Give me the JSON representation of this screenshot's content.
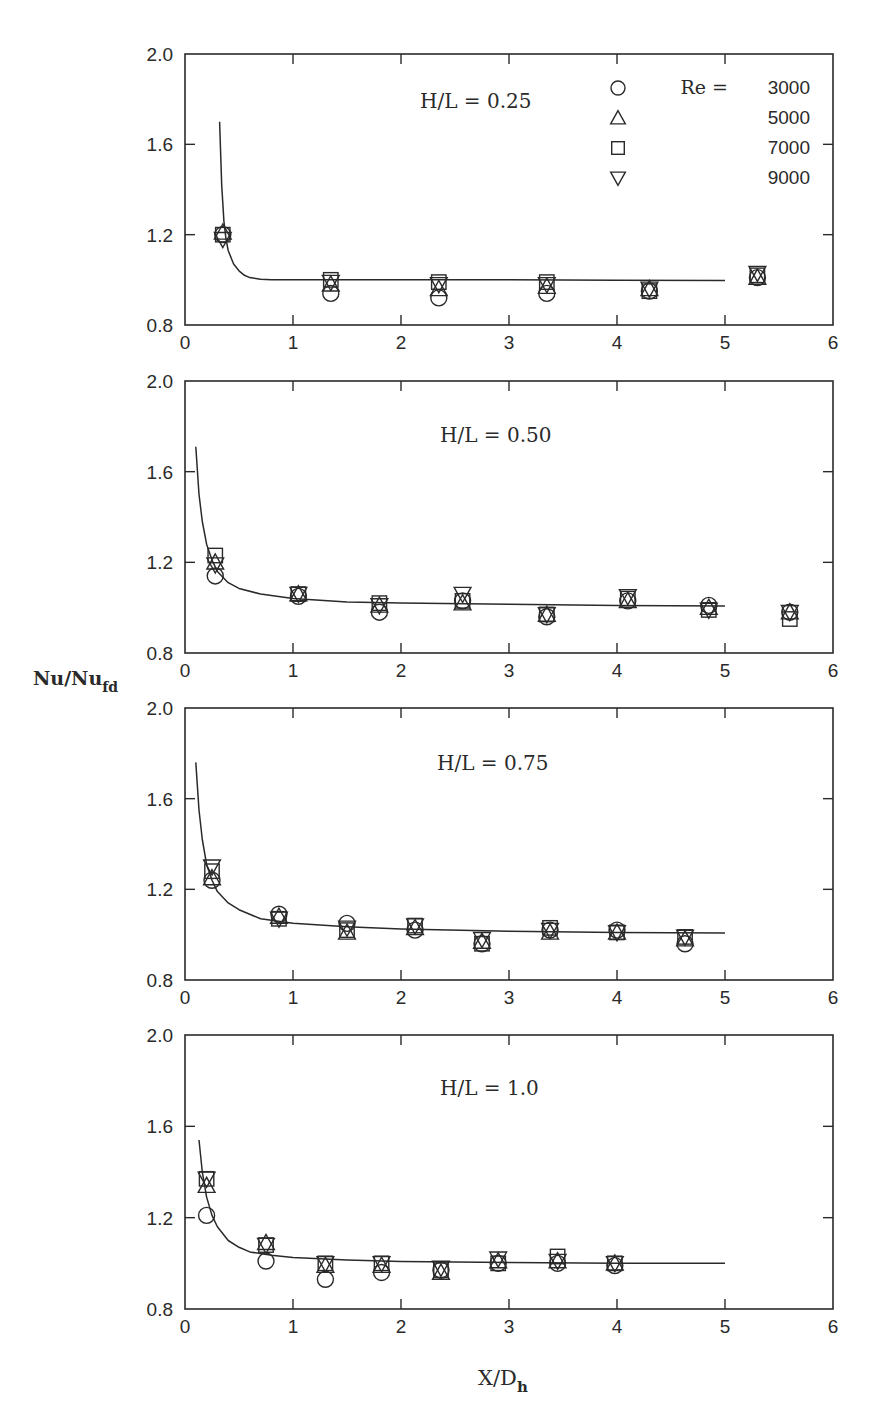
{
  "figure": {
    "ylabel_main": "Nu/Nu",
    "ylabel_sub": "fd",
    "xlabel_main": "X/D",
    "xlabel_sub": "h",
    "legend": {
      "title_prefix": "Re =",
      "entries": [
        {
          "symbol": "circle",
          "label": "3000"
        },
        {
          "symbol": "triangle-up",
          "label": "5000"
        },
        {
          "symbol": "square",
          "label": "7000"
        },
        {
          "symbol": "triangle-down",
          "label": "9000"
        }
      ]
    }
  },
  "chart_data": [
    {
      "type": "scatter",
      "title": "H/L = 0.25",
      "xlabel": "X/D_h",
      "ylabel": "Nu/Nu_fd",
      "xlim": [
        0,
        6
      ],
      "ylim": [
        0.8,
        2.0
      ],
      "xticks": [
        "0",
        "1",
        "2",
        "3",
        "4",
        "5",
        "6"
      ],
      "yticks": [
        "0.8",
        "1.2",
        "1.6",
        "2.0"
      ],
      "grid": false,
      "legend_position": "upper right",
      "x": [
        0.35,
        1.35,
        2.35,
        3.35,
        4.3,
        5.3
      ],
      "series": [
        {
          "name": "Re = 3000",
          "marker": "circle",
          "values": [
            1.2,
            0.94,
            0.92,
            0.94,
            0.95,
            1.01
          ]
        },
        {
          "name": "Re = 5000",
          "marker": "triangle-up",
          "values": [
            1.21,
            0.98,
            0.96,
            0.97,
            0.96,
            1.01
          ]
        },
        {
          "name": "Re = 7000",
          "marker": "square",
          "values": [
            1.2,
            1.0,
            0.99,
            0.99,
            0.95,
            1.02
          ]
        },
        {
          "name": "Re = 9000",
          "marker": "triangle-down",
          "values": [
            1.18,
            0.99,
            0.98,
            0.98,
            0.96,
            1.03
          ]
        }
      ],
      "fit_curve": {
        "x": [
          0.32,
          0.34,
          0.36,
          0.38,
          0.4,
          0.45,
          0.5,
          0.55,
          0.6,
          0.7,
          0.8,
          1.0,
          2.0,
          3.0,
          4.0,
          5.0
        ],
        "y": [
          1.7,
          1.42,
          1.26,
          1.18,
          1.13,
          1.07,
          1.04,
          1.02,
          1.01,
          1.003,
          1.0,
          1.0,
          1.0,
          1.0,
          0.998,
          0.997
        ]
      }
    },
    {
      "type": "scatter",
      "title": "H/L = 0.50",
      "xlabel": "X/D_h",
      "ylabel": "Nu/Nu_fd",
      "xlim": [
        0,
        6
      ],
      "ylim": [
        0.8,
        2.0
      ],
      "xticks": [
        "0",
        "1",
        "2",
        "3",
        "4",
        "5",
        "6"
      ],
      "yticks": [
        "0.8",
        "1.2",
        "1.6",
        "2.0"
      ],
      "grid": false,
      "x": [
        0.28,
        1.05,
        1.8,
        2.57,
        3.35,
        4.1,
        4.85,
        5.6
      ],
      "series": [
        {
          "name": "Re = 3000",
          "marker": "circle",
          "values": [
            1.14,
            1.05,
            0.98,
            1.03,
            0.96,
            1.03,
            1.01,
            0.98
          ]
        },
        {
          "name": "Re = 5000",
          "marker": "triangle-up",
          "values": [
            1.2,
            1.06,
            1.01,
            1.02,
            0.97,
            1.03,
            1.0,
            0.98
          ]
        },
        {
          "name": "Re = 7000",
          "marker": "square",
          "values": [
            1.23,
            1.06,
            1.02,
            1.03,
            0.97,
            1.04,
            0.99,
            0.95
          ]
        },
        {
          "name": "Re = 9000",
          "marker": "triangle-down",
          "values": [
            1.19,
            1.06,
            1.01,
            1.06,
            0.97,
            1.05,
            0.99,
            0.98
          ]
        }
      ],
      "fit_curve": {
        "x": [
          0.1,
          0.13,
          0.16,
          0.2,
          0.25,
          0.3,
          0.4,
          0.5,
          0.7,
          1.0,
          1.5,
          2.0,
          3.0,
          4.0,
          5.0
        ],
        "y": [
          1.71,
          1.5,
          1.38,
          1.28,
          1.21,
          1.16,
          1.11,
          1.085,
          1.06,
          1.04,
          1.025,
          1.02,
          1.015,
          1.01,
          1.008
        ]
      }
    },
    {
      "type": "scatter",
      "title": "H/L = 0.75",
      "xlabel": "X/D_h",
      "ylabel": "Nu/Nu_fd",
      "xlim": [
        0,
        6
      ],
      "ylim": [
        0.8,
        2.0
      ],
      "xticks": [
        "0",
        "1",
        "2",
        "3",
        "4",
        "5",
        "6"
      ],
      "yticks": [
        "0.8",
        "1.2",
        "1.6",
        "2.0"
      ],
      "grid": false,
      "x": [
        0.25,
        0.87,
        1.5,
        2.13,
        2.75,
        3.38,
        4.0,
        4.63
      ],
      "series": [
        {
          "name": "Re = 3000",
          "marker": "circle",
          "values": [
            1.24,
            1.09,
            1.05,
            1.02,
            0.96,
            1.02,
            1.02,
            0.96
          ]
        },
        {
          "name": "Re = 5000",
          "marker": "triangle-up",
          "values": [
            1.25,
            1.08,
            1.01,
            1.03,
            0.97,
            1.01,
            1.01,
            0.98
          ]
        },
        {
          "name": "Re = 7000",
          "marker": "square",
          "values": [
            1.28,
            1.07,
            1.02,
            1.04,
            0.96,
            1.03,
            1.01,
            0.99
          ]
        },
        {
          "name": "Re = 9000",
          "marker": "triangle-down",
          "values": [
            1.3,
            1.07,
            1.03,
            1.04,
            0.98,
            1.02,
            1.01,
            0.99
          ]
        }
      ],
      "fit_curve": {
        "x": [
          0.1,
          0.13,
          0.16,
          0.2,
          0.25,
          0.3,
          0.4,
          0.5,
          0.7,
          1.0,
          1.5,
          2.0,
          3.0,
          4.0,
          5.0
        ],
        "y": [
          1.76,
          1.55,
          1.42,
          1.31,
          1.24,
          1.19,
          1.14,
          1.11,
          1.07,
          1.05,
          1.035,
          1.025,
          1.015,
          1.01,
          1.007
        ]
      }
    },
    {
      "type": "scatter",
      "title": "H/L = 1.0",
      "xlabel": "X/D_h",
      "ylabel": "Nu/Nu_fd",
      "xlim": [
        0,
        6
      ],
      "ylim": [
        0.8,
        2.0
      ],
      "xticks": [
        "0",
        "1",
        "2",
        "3",
        "4",
        "5",
        "6"
      ],
      "yticks": [
        "0.8",
        "1.2",
        "1.6",
        "2.0"
      ],
      "grid": false,
      "x": [
        0.2,
        0.75,
        1.3,
        1.82,
        2.37,
        2.9,
        3.45,
        3.98
      ],
      "series": [
        {
          "name": "Re = 3000",
          "marker": "circle",
          "values": [
            1.21,
            1.01,
            0.93,
            0.96,
            0.97,
            1.0,
            1.0,
            0.99
          ]
        },
        {
          "name": "Re = 5000",
          "marker": "triangle-up",
          "values": [
            1.34,
            1.09,
            0.99,
            0.99,
            0.96,
            1.01,
            1.01,
            1.0
          ]
        },
        {
          "name": "Re = 7000",
          "marker": "square",
          "values": [
            1.37,
            1.08,
            1.0,
            1.0,
            0.97,
            1.0,
            1.03,
            1.0
          ]
        },
        {
          "name": "Re = 9000",
          "marker": "triangle-down",
          "values": [
            1.37,
            1.08,
            1.0,
            1.0,
            0.98,
            1.02,
            1.01,
            1.0
          ]
        }
      ],
      "fit_curve": {
        "x": [
          0.13,
          0.16,
          0.2,
          0.25,
          0.3,
          0.4,
          0.5,
          0.6,
          0.8,
          1.0,
          1.5,
          2.0,
          3.0,
          4.0,
          5.0
        ],
        "y": [
          1.54,
          1.4,
          1.29,
          1.21,
          1.16,
          1.1,
          1.07,
          1.05,
          1.035,
          1.025,
          1.015,
          1.008,
          1.004,
          1.0,
          1.0
        ]
      }
    }
  ]
}
